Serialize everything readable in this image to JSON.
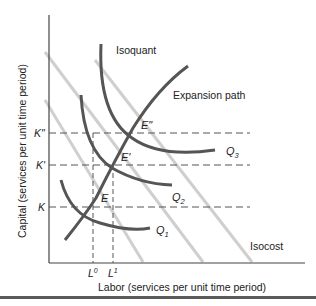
{
  "diagram": {
    "type": "isoquant-isocost",
    "y_axis_label": "Capital (services per unit time period)",
    "x_axis_label": "Labor (services per unit time period)",
    "labels": {
      "isoquant": "Isoquant",
      "expansion_path": "Expansion path",
      "isocost": "Isocost"
    },
    "isoquants": [
      {
        "name": "Q",
        "sub": "1"
      },
      {
        "name": "Q",
        "sub": "2"
      },
      {
        "name": "Q",
        "sub": "3"
      }
    ],
    "equilibria": [
      {
        "label": "E"
      },
      {
        "label": "E'"
      },
      {
        "label": "E\""
      }
    ],
    "y_ticks": [
      {
        "label": "K\""
      },
      {
        "label": "K'"
      },
      {
        "label": "K"
      }
    ],
    "x_ticks": [
      {
        "base": "L",
        "sup": "0"
      },
      {
        "base": "L",
        "sup": "1"
      }
    ],
    "colors": {
      "curve": "#555555",
      "isocost": "#c8c8c8",
      "axis": "#444444",
      "dashed": "#555555"
    }
  }
}
